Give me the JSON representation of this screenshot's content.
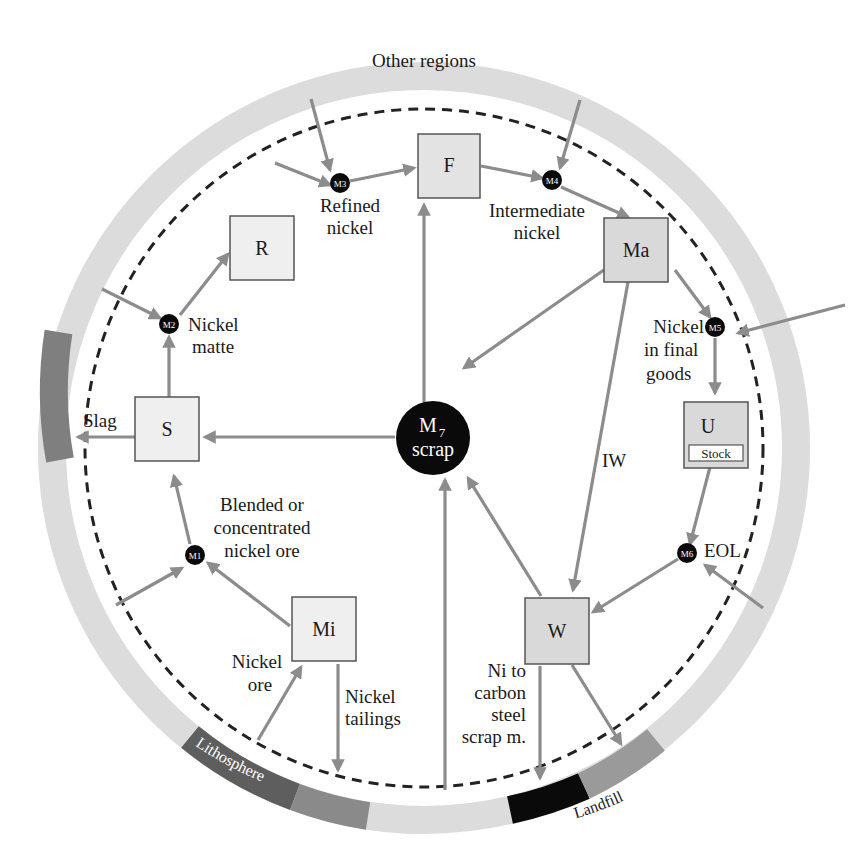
{
  "diagram": {
    "colors": {
      "ring": "#dcdcdc",
      "ring_dark": "#7f7f7f",
      "ring_black": "#0a0a0a",
      "flow": "#8c8c8c",
      "box_fill": "#eeeeee",
      "box_fill_dark": "#d9d9d9",
      "node": "#0a0a0a"
    },
    "ring_labels": {
      "other_regions": "Other regions",
      "lithosphere": "Lithosphere",
      "landfill": "Landfill"
    },
    "processes": {
      "F": "F",
      "R": "R",
      "Ma": "Ma",
      "S": "S",
      "U": "U",
      "stock": "Stock",
      "Mi": "Mi",
      "W": "W"
    },
    "markets": {
      "m1": "M1",
      "m2": "M2",
      "m3": "M3",
      "m4": "M4",
      "m5": "M5",
      "m6": "M6",
      "m7_main": "M",
      "m7_sub": "7",
      "m7_label": "scrap"
    },
    "flow_labels": {
      "refined_nickel_1": "Refined",
      "refined_nickel_2": "nickel",
      "intermediate_nickel_1": "Intermediate",
      "intermediate_nickel_2": "nickel",
      "nickel_matte_1": "Nickel",
      "nickel_matte_2": "matte",
      "final_goods_1": "Nickel",
      "final_goods_2": "in final",
      "final_goods_3": "goods",
      "slag": "Slag",
      "iw": "IW",
      "eol": "EOL",
      "blended_1": "Blended or",
      "blended_2": "concentrated",
      "blended_3": "nickel ore",
      "nickel_ore_1": "Nickel",
      "nickel_ore_2": "ore",
      "tailings_1": "Nickel",
      "tailings_2": "tailings",
      "carbon_steel_1": "Ni to",
      "carbon_steel_2": "carbon",
      "carbon_steel_3": "steel",
      "carbon_steel_4": "scrap m."
    }
  }
}
